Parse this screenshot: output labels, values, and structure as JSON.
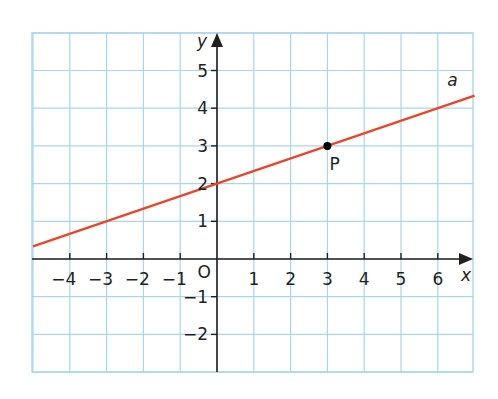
{
  "chart_data": {
    "type": "line",
    "title": "",
    "xlabel": "x",
    "ylabel": "y",
    "xlim": [
      -5,
      7
    ],
    "ylim": [
      -3,
      6
    ],
    "grid": true,
    "origin_label": "O",
    "x_ticks": [
      -4,
      -3,
      -2,
      -1,
      1,
      2,
      3,
      4,
      5,
      6
    ],
    "y_ticks": [
      -2,
      -1,
      1,
      2,
      3,
      4,
      5
    ],
    "x_tick_labels": [
      "−4",
      "−3",
      "−2",
      "−1",
      "1",
      "2",
      "3",
      "4",
      "5",
      "6"
    ],
    "y_tick_labels": [
      "−2",
      "−1",
      "1",
      "2",
      "3",
      "4",
      "5"
    ],
    "series": [
      {
        "name": "a",
        "label": "a",
        "equation": "y = x/3 + 2",
        "slope": 0.3333,
        "intercept": 2,
        "x": [
          -5,
          7
        ],
        "y": [
          0.333,
          4.333
        ],
        "color": "#e8462a"
      }
    ],
    "points": [
      {
        "name": "P",
        "label": "P",
        "x": 3,
        "y": 3
      }
    ],
    "colors": {
      "grid": "#a9d6ec",
      "axes": "#231f20",
      "line": "#e8462a",
      "point": "#000000"
    }
  }
}
